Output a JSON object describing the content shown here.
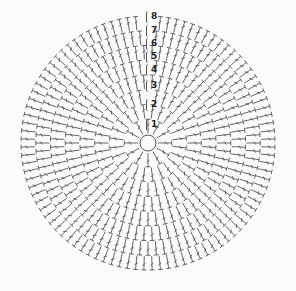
{
  "diagram": {
    "type": "crochet-round-chart",
    "stitch_symbol": "double-crochet",
    "center": {
      "x": 148,
      "y": 143,
      "ring_radius": 8
    },
    "outer_radius": 128,
    "round_count": 8,
    "line_color": "#555555",
    "background": "#fbfbfb",
    "round_labels": [
      {
        "label": "1",
        "y": 124
      },
      {
        "label": "2",
        "y": 104
      },
      {
        "label": "3",
        "y": 85
      },
      {
        "label": "4",
        "y": 69
      },
      {
        "label": "5",
        "y": 56
      },
      {
        "label": "6",
        "y": 43
      },
      {
        "label": "7",
        "y": 30
      },
      {
        "label": "8",
        "y": 16
      }
    ]
  }
}
